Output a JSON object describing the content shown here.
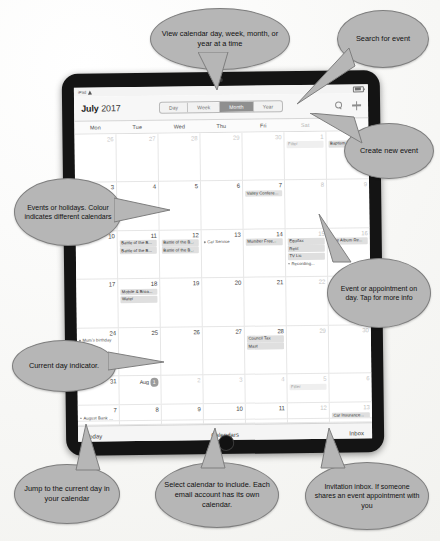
{
  "device": {
    "status_bar": {
      "carrier": "iPad",
      "wifi_icon": "wifi-icon",
      "battery_icon": "battery-icon"
    }
  },
  "calendar": {
    "title_month": "July",
    "title_year": "2017",
    "view_options": [
      {
        "label": "Day",
        "selected": false
      },
      {
        "label": "Week",
        "selected": false
      },
      {
        "label": "Month",
        "selected": true
      },
      {
        "label": "Year",
        "selected": false
      }
    ],
    "search_icon": "search-icon",
    "add_icon": "plus-icon",
    "weekdays": [
      {
        "label": "Mon",
        "dim": false
      },
      {
        "label": "Tue",
        "dim": false
      },
      {
        "label": "Wed",
        "dim": false
      },
      {
        "label": "Thu",
        "dim": false
      },
      {
        "label": "Fri",
        "dim": false
      },
      {
        "label": "Sat",
        "dim": true
      },
      {
        "label": "Sun",
        "dim": true
      }
    ],
    "weeks": [
      [
        {
          "day": "26",
          "other": true,
          "events": []
        },
        {
          "day": "27",
          "other": true,
          "events": []
        },
        {
          "day": "28",
          "other": true,
          "events": []
        },
        {
          "day": "29",
          "other": true,
          "events": []
        },
        {
          "day": "30",
          "other": true,
          "events": []
        },
        {
          "day": "1",
          "weekend": true,
          "events": [
            {
              "text": "Filter",
              "style": "faint"
            }
          ]
        },
        {
          "day": "2",
          "weekend": true,
          "events": [
            {
              "text": "Baptism R...",
              "style": "bar"
            }
          ]
        }
      ],
      [
        {
          "day": "3",
          "events": [
            {
              "text": "Lunt resort...",
              "style": "dot"
            }
          ]
        },
        {
          "day": "4",
          "events": []
        },
        {
          "day": "5",
          "events": []
        },
        {
          "day": "6",
          "events": []
        },
        {
          "day": "7",
          "events": [
            {
              "text": "Valley Conference 2017",
              "style": "wide"
            }
          ]
        },
        {
          "day": "8",
          "weekend": true,
          "events": []
        },
        {
          "day": "9",
          "weekend": true,
          "events": []
        }
      ],
      [
        {
          "day": "10",
          "events": []
        },
        {
          "day": "11",
          "events": [
            {
              "text": "Battle of the B...",
              "style": "bar"
            },
            {
              "text": "Battle of the B...",
              "style": "bar"
            }
          ]
        },
        {
          "day": "12",
          "events": [
            {
              "text": "Battle of the B...",
              "style": "bar"
            },
            {
              "text": "Battle of the B...",
              "style": "bar"
            }
          ]
        },
        {
          "day": "13",
          "events": [
            {
              "text": "Car Service",
              "style": "dot"
            }
          ]
        },
        {
          "day": "14",
          "events": [
            {
              "text": "Mumber Free...",
              "style": "bar"
            }
          ]
        },
        {
          "day": "15",
          "weekend": true,
          "events": [
            {
              "text": "Equifax",
              "style": "bar"
            },
            {
              "text": "Rent",
              "style": "bar"
            },
            {
              "text": "TV Lic",
              "style": "bar"
            },
            {
              "text": "Recording...",
              "style": "dot"
            }
          ]
        },
        {
          "day": "16",
          "weekend": true,
          "events": [
            {
              "text": "Live Album Re...",
              "style": "bar"
            }
          ]
        }
      ],
      [
        {
          "day": "17",
          "events": []
        },
        {
          "day": "18",
          "events": [
            {
              "text": "Mobile & Broa...",
              "style": "bar"
            },
            {
              "text": "Water",
              "style": "bar"
            }
          ]
        },
        {
          "day": "19",
          "events": []
        },
        {
          "day": "20",
          "events": []
        },
        {
          "day": "21",
          "events": []
        },
        {
          "day": "22",
          "weekend": true,
          "events": []
        },
        {
          "day": "23",
          "weekend": true,
          "events": []
        }
      ],
      [
        {
          "day": "24",
          "events": [
            {
              "text": "Mum's birthday",
              "style": "dot"
            }
          ]
        },
        {
          "day": "25",
          "events": []
        },
        {
          "day": "26",
          "events": []
        },
        {
          "day": "27",
          "events": []
        },
        {
          "day": "28",
          "events": [
            {
              "text": "Council Tax",
              "style": "bar"
            },
            {
              "text": "Mast",
              "style": "bar"
            }
          ]
        },
        {
          "day": "29",
          "weekend": true,
          "events": []
        },
        {
          "day": "30",
          "weekend": true,
          "events": []
        }
      ],
      [
        {
          "day": "31",
          "events": []
        },
        {
          "day": "1",
          "month_prefix": "Aug",
          "today": true,
          "events": []
        },
        {
          "day": "2",
          "other": true,
          "events": []
        },
        {
          "day": "3",
          "other": true,
          "events": []
        },
        {
          "day": "4",
          "other": true,
          "events": []
        },
        {
          "day": "5",
          "other": true,
          "weekend": true,
          "events": [
            {
              "text": "Filter",
              "style": "faint"
            }
          ]
        },
        {
          "day": "6",
          "other": true,
          "weekend": true,
          "events": []
        }
      ]
    ],
    "extra_week": [
      {
        "day": "7",
        "events": [
          {
            "text": "August Bank H...",
            "style": "dot"
          },
          {
            "text": "Summer Bank...",
            "style": "dot"
          }
        ]
      },
      {
        "day": "8",
        "events": []
      },
      {
        "day": "9",
        "events": []
      },
      {
        "day": "10",
        "events": []
      },
      {
        "day": "11",
        "events": []
      },
      {
        "day": "12",
        "weekend": true,
        "events": []
      },
      {
        "day": "13",
        "weekend": true,
        "events": [
          {
            "text": "Car Insurance...",
            "style": "bar"
          }
        ]
      }
    ],
    "toolbar": {
      "today_label": "Today",
      "calendars_label": "Calendars",
      "inbox_label": "Inbox"
    }
  },
  "annotations": [
    {
      "id": "view-modes",
      "text": "View calendar day, week, month, or year at a time"
    },
    {
      "id": "search",
      "text": "Search for event"
    },
    {
      "id": "create",
      "text": "Create new event"
    },
    {
      "id": "events",
      "text": "Events or holidays. Colour indicates different calendars"
    },
    {
      "id": "appointment",
      "text": "Event or appointment on day. Tap for more info"
    },
    {
      "id": "current-day",
      "text": "Current day indicator."
    },
    {
      "id": "today-btn",
      "text": "Jump to the current day in your calendar"
    },
    {
      "id": "calendars",
      "text": "Select calendar to include. Each email account has its own calendar."
    },
    {
      "id": "inbox",
      "text": "Invitation inbox. If someone shares an event appointment with you"
    }
  ],
  "colors": {
    "bubble_fill": "#b6b6b6",
    "bubble_stroke": "#7e7e7e",
    "device_body": "#141414",
    "segment_selected": "#8f8f8f",
    "today_indicator": "#9b9b9b"
  }
}
